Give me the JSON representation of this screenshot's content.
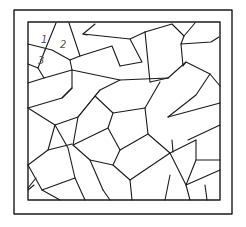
{
  "figure": {
    "line_color": "#1a1a1a",
    "label_color": "#555555",
    "cell_labels": [
      "1",
      "2",
      "3"
    ]
  }
}
